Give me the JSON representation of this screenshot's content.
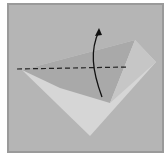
{
  "diagram": {
    "type": "origami-fold-step",
    "colors": {
      "background": "#b5b5b5",
      "border": "#9a9a9a",
      "paper_light": "#d6d6d6",
      "flap_dark": "#a9a9a9",
      "flap_side": "#c4c4c4",
      "fold_line": "#222222",
      "arrow": "#111111"
    },
    "elements": {
      "paper": "kite-shaped paper, light side",
      "flap": "folded flap, shaded",
      "fold_line": "dashed valley fold line (horizontal)",
      "arrow": "curved fold arrow pointing up"
    }
  }
}
